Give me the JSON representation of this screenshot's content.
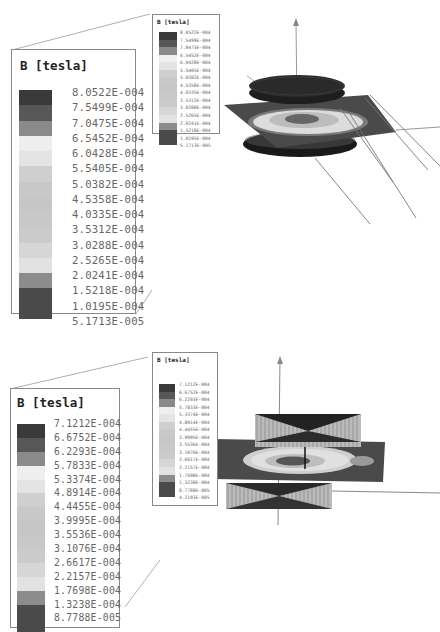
{
  "figure": {
    "panels": [
      {
        "id": "top",
        "legend_title": "B [tesla]",
        "levels": [
          "8.0522E-004",
          "7.5499E-004",
          "7.0475E-004",
          "6.5452E-004",
          "6.0428E-004",
          "5.5405E-004",
          "5.0382E-004",
          "4.5358E-004",
          "4.0335E-004",
          "3.5312E-004",
          "3.0288E-004",
          "2.5265E-004",
          "2.0241E-004",
          "1.5218E-004",
          "1.0195E-004",
          "5.1713E-005"
        ],
        "band_colors": [
          "#3a3a3a",
          "#575757",
          "#8a8a8a",
          "#eeeeee",
          "#e4e4e4",
          "#cfcfcf",
          "#c8c8c8",
          "#c6c6c6",
          "#c8c8c8",
          "#cbcbcb",
          "#d6d6d6",
          "#e2e2e2",
          "#8c8c8c",
          "#4a4a4a",
          "#4a4a4a"
        ],
        "axis_labels": {
          "z": "Z",
          "y": "Y"
        }
      },
      {
        "id": "bottom",
        "legend_title": "B [tesla]",
        "levels": [
          "7.1212E-004",
          "6.6752E-004",
          "6.2293E-004",
          "5.7833E-004",
          "5.3374E-004",
          "4.8914E-004",
          "4.4455E-004",
          "3.9995E-004",
          "3.5536E-004",
          "3.1076E-004",
          "2.6617E-004",
          "2.2157E-004",
          "1.7698E-004",
          "1.3238E-004",
          "8.7788E-005",
          "4.3193E-005"
        ],
        "band_colors": [
          "#3a3a3a",
          "#575757",
          "#8a8a8a",
          "#eeeeee",
          "#e4e4e4",
          "#cfcfcf",
          "#c8c8c8",
          "#c6c6c6",
          "#c8c8c8",
          "#cbcbcb",
          "#d6d6d6",
          "#e2e2e2",
          "#8c8c8c",
          "#4a4a4a",
          "#4a4a4a"
        ],
        "axis_labels": {
          "z": "Z"
        }
      }
    ]
  }
}
